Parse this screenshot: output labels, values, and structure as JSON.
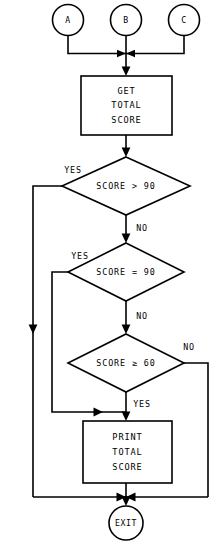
{
  "diagram": {
    "type": "flowchart",
    "stroke_color": "#000000",
    "background_color": "#ffffff",
    "connectors": {
      "entry_a": "A",
      "entry_b": "B",
      "entry_c": "C"
    },
    "process_get": {
      "line1": "GET",
      "line2": "TOTAL",
      "line3": "SCORE"
    },
    "decision_1": {
      "text": "SCORE > 90",
      "yes_label": "YES",
      "no_label": "NO"
    },
    "decision_2": {
      "text": "SCORE = 90",
      "yes_label": "YES",
      "no_label": "NO"
    },
    "decision_3": {
      "text": "SCORE ≥ 60",
      "yes_label": "YES",
      "no_label": "NO"
    },
    "process_print": {
      "line1": "PRINT",
      "line2": "TOTAL",
      "line3": "SCORE"
    },
    "terminator_exit": {
      "text": "EXIT"
    }
  }
}
